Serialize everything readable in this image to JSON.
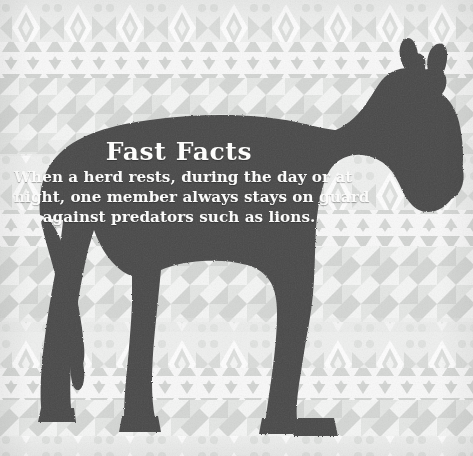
{
  "card": {
    "width": 473,
    "height": 456,
    "kind": "fast-facts-infographic-card",
    "subject": "zebra"
  },
  "fact": {
    "title": "Fast Facts",
    "body_lines": [
      "When a herd rests, during the day or at",
      "night, one member always stays on guard",
      "against predators such as lions."
    ],
    "body_full": "When a herd rests, during the day or at night, one member always stays on guard against predators such as lions."
  },
  "colors": {
    "silhouette": "#4a4a4a",
    "background_base": "#f4f4f3",
    "pattern_motif": "#d5d7d5",
    "pattern_motif_light": "#e4e6e4",
    "pattern_band_tint": "#eceeec",
    "text": "#ffffff"
  },
  "illustration": {
    "silhouette_name": "zebra-silhouette",
    "facing": "right",
    "parts": [
      "ears",
      "head",
      "muzzle",
      "neck",
      "mane",
      "body",
      "tail",
      "front-legs",
      "hind-legs",
      "hooves"
    ]
  },
  "pattern": {
    "style": "african-tribal-geometric",
    "band_order": [
      "diamond-star-band",
      "up-triangle-row",
      "down-triangle-row",
      "pinwheel-square-band",
      "diamond-star-band",
      "up-triangle-row",
      "down-triangle-row",
      "pinwheel-square-band"
    ],
    "band_repeat_height": 114
  }
}
